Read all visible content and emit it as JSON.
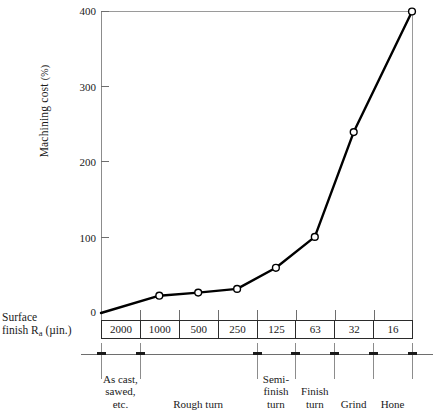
{
  "chart_data": {
    "type": "line",
    "title": "",
    "ylabel": "Machining cost (%)",
    "xlabel": "Surface finish Ra (µin.)",
    "ylim": [
      0,
      400
    ],
    "yticks": [
      0,
      100,
      200,
      300,
      400
    ],
    "ytick_labels": [
      "0",
      "100",
      "200",
      "300",
      "400"
    ],
    "categories": [
      "2000",
      "1000",
      "500",
      "250",
      "125",
      "63",
      "32",
      "16"
    ],
    "values": [
      0,
      23,
      27,
      32,
      60,
      101,
      240,
      400
    ],
    "grid": false,
    "legend": null,
    "marker": "open-circle",
    "line_color": "#000000",
    "axis_color": "#8c8c8c",
    "process_bands": [
      {
        "label": "As cast, sawed, etc.",
        "lines": [
          "As cast,",
          "sawed,",
          "etc."
        ],
        "span": [
          0,
          1
        ]
      },
      {
        "label": "Rough turn",
        "lines": [
          "Rough turn"
        ],
        "span": [
          1,
          4
        ]
      },
      {
        "label": "Semi-finish turn",
        "lines": [
          "Semi-",
          "finish",
          "turn"
        ],
        "span": [
          4,
          5
        ]
      },
      {
        "label": "Finish turn",
        "lines": [
          "Finish",
          "turn"
        ],
        "span": [
          5,
          6
        ]
      },
      {
        "label": "Grind",
        "lines": [
          "Grind"
        ],
        "span": [
          6,
          7
        ]
      },
      {
        "label": "Hone",
        "lines": [
          "Hone"
        ],
        "span": [
          7,
          8
        ]
      }
    ]
  },
  "axis": {
    "y_label_main": "Machining cost",
    "y_label_unit": "(%)",
    "x_label_line1": "Surface",
    "x_label_line2_a": "finish R",
    "x_label_line2_sub": "a",
    "x_label_line2_b": " (µin.)"
  }
}
